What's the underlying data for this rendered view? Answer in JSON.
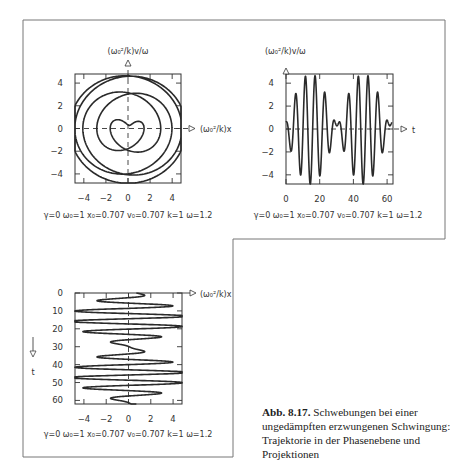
{
  "figure": {
    "caption_label": "Abb. 8.17.",
    "caption_text": "Schwebungen bei einer ungedämpften erzwungenen Schwingung: Trajektorie in der Phasenebene und Projektionen",
    "params_text": "γ=0  ω₀=1  x₀=0.707  v₀=0.707  k=1  ω=1.2",
    "line_color": "#2a2a2a",
    "frame_color": "#666666"
  },
  "chart_data": [
    {
      "id": "phase",
      "type": "line",
      "title": "",
      "xlabel": "(ω₀²/k)x",
      "ylabel": "(ω₀²/k)v/ω",
      "xlim": [
        -4.8,
        4.8
      ],
      "ylim": [
        -4.8,
        4.8
      ],
      "xticks": [
        -4,
        -2,
        0,
        2,
        4
      ],
      "yticks": [
        -4,
        -2,
        0,
        2,
        4
      ],
      "xtick_labels": [
        "−4",
        "−2",
        "0",
        "2",
        "4"
      ],
      "ytick_labels": [
        "−4",
        "−2",
        "0",
        "2",
        "4"
      ],
      "grid": false,
      "dashed_zero_axes": true,
      "series": [
        {
          "name": "trajectory",
          "x_of": "x",
          "y_of": "v_over_omega",
          "t_range": [
            0,
            62.83
          ]
        }
      ],
      "params": {
        "gamma": 0,
        "omega0": 1,
        "x0": 0.707,
        "v0": 0.707,
        "k": 1,
        "omega": 1.2
      }
    },
    {
      "id": "velocity_time",
      "type": "line",
      "title": "",
      "xlabel": "t",
      "ylabel": "(ω₀²/k)v/ω",
      "xlim": [
        0,
        63.5
      ],
      "ylim": [
        -4.8,
        4.8
      ],
      "xticks": [
        0,
        20,
        40,
        60
      ],
      "yticks": [
        -4,
        -2,
        0,
        2,
        4
      ],
      "xtick_labels": [
        "0",
        "20",
        "40",
        "60"
      ],
      "ytick_labels": [
        "−4",
        "−2",
        "0",
        "2",
        "4"
      ],
      "grid": false,
      "dashed_zero_axes": true,
      "series": [
        {
          "name": "v(t)",
          "x_of": "t",
          "y_of": "v_over_omega",
          "t_range": [
            0,
            62.83
          ]
        }
      ],
      "sample_points": {
        "t": [
          0,
          10,
          20,
          30,
          40,
          50,
          60
        ],
        "v_over_omega": [
          0.59,
          -1.2,
          2.1,
          0.7,
          -2.3,
          4.0,
          0.6
        ]
      },
      "params": {
        "gamma": 0,
        "omega0": 1,
        "x0": 0.707,
        "v0": 0.707,
        "k": 1,
        "omega": 1.2
      }
    },
    {
      "id": "position_time",
      "type": "line",
      "title": "",
      "xlabel": "(ω₀²/k)x",
      "ylabel": "t",
      "xlim": [
        -4.8,
        4.8
      ],
      "ylim": [
        0,
        62
      ],
      "y_inverted": true,
      "xticks": [
        -4,
        -2,
        0,
        2,
        4
      ],
      "yticks": [
        0,
        10,
        20,
        30,
        40,
        50,
        60
      ],
      "xtick_labels": [
        "−4",
        "−2",
        "0",
        "2",
        "4"
      ],
      "ytick_labels": [
        "0",
        "10",
        "20",
        "30",
        "40",
        "50",
        "60"
      ],
      "grid": false,
      "dashed_zero_axes": true,
      "series": [
        {
          "name": "x(t)",
          "x_of": "x",
          "y_of": "t",
          "t_range": [
            0,
            62.83
          ]
        }
      ],
      "params": {
        "gamma": 0,
        "omega0": 1,
        "x0": 0.707,
        "v0": 0.707,
        "k": 1,
        "omega": 1.2
      }
    }
  ]
}
